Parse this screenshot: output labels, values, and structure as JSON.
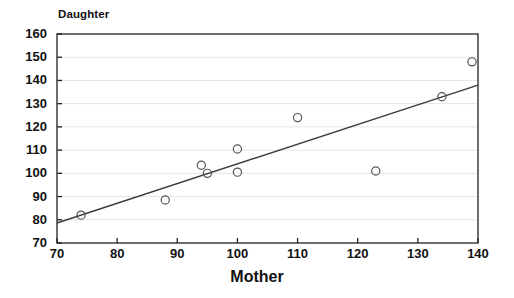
{
  "chart_data": {
    "type": "scatter",
    "title": "",
    "xlabel": "Mother",
    "ylabel": "Daughter",
    "xlim": [
      70,
      140
    ],
    "ylim": [
      70,
      160
    ],
    "xticks": [
      70,
      80,
      90,
      100,
      110,
      120,
      130,
      140
    ],
    "yticks": [
      70,
      80,
      90,
      100,
      110,
      120,
      130,
      140,
      150,
      160
    ],
    "grid": "horizontal",
    "legend": "none",
    "marker": "open-circle",
    "points": [
      {
        "x": 74,
        "y": 82
      },
      {
        "x": 88,
        "y": 88.5
      },
      {
        "x": 94,
        "y": 103.5
      },
      {
        "x": 95,
        "y": 100
      },
      {
        "x": 100,
        "y": 110.5
      },
      {
        "x": 100,
        "y": 100.5
      },
      {
        "x": 110,
        "y": 124
      },
      {
        "x": 123,
        "y": 101
      },
      {
        "x": 134,
        "y": 133
      },
      {
        "x": 139,
        "y": 148
      }
    ],
    "series": [
      {
        "name": "regression-line",
        "type": "line",
        "x": [
          70,
          140
        ],
        "values": [
          78.6,
          138.0
        ]
      }
    ],
    "colors": {
      "marker_stroke": "#555555",
      "line": "#3a3a3a",
      "axis": "#222222",
      "grid": "#e4e4e8",
      "background": "#ffffff",
      "text": "#111111"
    }
  }
}
